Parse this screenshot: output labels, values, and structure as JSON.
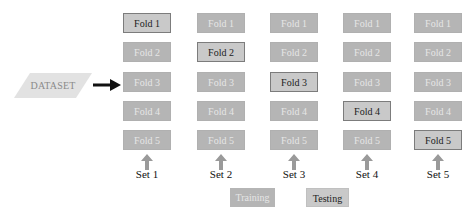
{
  "dataset": {
    "label": "DATASET"
  },
  "colors": {
    "training_fill": "#b5b5b5",
    "training_text": "#e6e6e6",
    "testing_fill": "#c9c9c9",
    "testing_border": "#7c7c7c",
    "testing_text": "#222222",
    "dataset_fill": "#e2e2e2",
    "arrow": "#111111",
    "set_arrow": "#9a9a9a"
  },
  "sets": [
    {
      "label": "Set 1",
      "folds": [
        "Fold 1",
        "Fold 2",
        "Fold 3",
        "Fold 4",
        "Fold 5"
      ],
      "test_index": 0
    },
    {
      "label": "Set 2",
      "folds": [
        "Fold 1",
        "Fold 2",
        "Fold 3",
        "Fold 4",
        "Fold 5"
      ],
      "test_index": 1
    },
    {
      "label": "Set 3",
      "folds": [
        "Fold 1",
        "Fold 2",
        "Fold 3",
        "Fold 4",
        "Fold 5"
      ],
      "test_index": 2
    },
    {
      "label": "Set 4",
      "folds": [
        "Fold 1",
        "Fold 2",
        "Fold 3",
        "Fold 4",
        "Fold 5"
      ],
      "test_index": 3
    },
    {
      "label": "Set 5",
      "folds": [
        "Fold 1",
        "Fold 2",
        "Fold 3",
        "Fold 4",
        "Fold 5"
      ],
      "test_index": 4
    }
  ],
  "legend": {
    "training": "Training",
    "testing": "Testing"
  }
}
